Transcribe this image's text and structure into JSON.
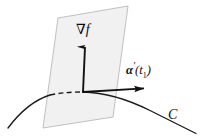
{
  "figure": {
    "background_color": "#ffffff",
    "width": 212,
    "height": 136
  },
  "labels": {
    "gradient": {
      "nabla": "∇",
      "function": "f",
      "full": "∇f",
      "name": "gradient-vector-label"
    },
    "tangent": {
      "alpha": "α",
      "prime": "′",
      "open_paren": "(",
      "t": "t",
      "subscript": "1",
      "close_paren": ")",
      "full": "α′(t₁)",
      "name": "tangent-vector-label"
    },
    "curve": {
      "text": "C",
      "name": "curve-label"
    }
  },
  "geometry": {
    "plane": {
      "points": "58,18 128,6 113,117 43,128",
      "fill": "#f1f1f1",
      "stroke": "#b9b9b9",
      "stroke_width": 0.9
    },
    "curve_solid_left": "M 8,128 C 20,112 34,100 50,95",
    "curve_dashed": "M 50,95 C 62,92 72,92 83,92",
    "curve_solid_right": "M 83,92 C 104,92 128,99 150,110 C 166,118 182,126 196,133",
    "gradient_vector": {
      "x1": 83,
      "y1": 92,
      "x2": 85,
      "y2": 46,
      "stroke": "#111111",
      "stroke_width": 1.8
    },
    "tangent_vector": {
      "x1": 83,
      "y1": 92,
      "x2": 146,
      "y2": 88,
      "stroke": "#111111",
      "stroke_width": 1.8
    }
  },
  "colors": {
    "ink": "#111111",
    "plane_fill": "#f1f1f1",
    "plane_edge": "#b9b9b9",
    "curve": "#1a1a1a",
    "background": "#ffffff"
  }
}
